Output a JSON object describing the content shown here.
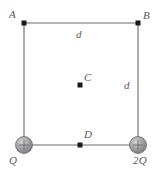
{
  "figure": {
    "type": "physics-diagram",
    "colors": {
      "edge": "#9a9a9c",
      "vertex_dot": "#1a1a1a",
      "charge_sphere": "#9d9d9f",
      "charge_sphere_highlight": "#d2d2d4",
      "charge_sphere_edge": "#6e6e70",
      "label": "#58585a",
      "background": "#ffffff"
    },
    "square": {
      "top_left": {
        "x": 24,
        "y": 23
      },
      "top_right": {
        "x": 138,
        "y": 23
      },
      "bottom_left": {
        "x": 24,
        "y": 145
      },
      "bottom_right": {
        "x": 138,
        "y": 145
      }
    },
    "vertices": [
      {
        "name": "A",
        "label": "A",
        "kind": "point",
        "x": 24,
        "y": 23
      },
      {
        "name": "B",
        "label": "B",
        "kind": "point",
        "x": 138,
        "y": 23
      },
      {
        "name": "Q",
        "label": "Q",
        "kind": "charge",
        "x": 24,
        "y": 145,
        "sign": "+"
      },
      {
        "name": "2Q",
        "label": "2Q",
        "kind": "charge",
        "x": 138,
        "y": 145,
        "sign": "+"
      }
    ],
    "interior_points": [
      {
        "name": "C",
        "label": "C",
        "x": 80,
        "y": 85
      },
      {
        "name": "D",
        "label": "D",
        "x": 80,
        "y": 145
      }
    ],
    "side_labels": [
      {
        "name": "d-top",
        "label": "d",
        "side": "top"
      },
      {
        "name": "d-right",
        "label": "d",
        "side": "right"
      }
    ]
  }
}
